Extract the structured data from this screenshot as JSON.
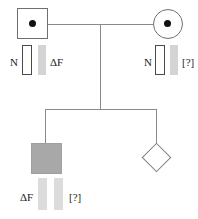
{
  "figure": {
    "width": 198,
    "height": 219,
    "background": "#ffffff",
    "line_color": "#8a8a8a",
    "symbol_border_color": "#6f6f6f",
    "affected_fill": "#a8a8a8",
    "carrier_dot_color": "#111111",
    "band_open_border": "#4a4a4a",
    "band_grey_color": "#d4d4d4",
    "band_grey_light_color": "#dcdcdc"
  },
  "individuals": {
    "father": {
      "symbol": "square",
      "status": "carrier",
      "sex": "male"
    },
    "mother": {
      "symbol": "circle",
      "status": "carrier",
      "sex": "female"
    },
    "child_affected": {
      "symbol": "square",
      "status": "affected",
      "sex": "male"
    },
    "fetus": {
      "symbol": "diamond",
      "status": "unknown",
      "sex": "unknown"
    }
  },
  "lanes": {
    "father": {
      "left_label": "N",
      "right_label": "ΔF",
      "allele_normal": "N",
      "allele_mutant": "ΔF"
    },
    "mother": {
      "left_label": "N",
      "right_label": "[?]",
      "allele_normal": "N",
      "allele_mutant": "[?]"
    },
    "child_affected": {
      "left_label": "ΔF",
      "right_label": "[?]",
      "allele_one": "ΔF",
      "allele_two": "[?]"
    }
  }
}
